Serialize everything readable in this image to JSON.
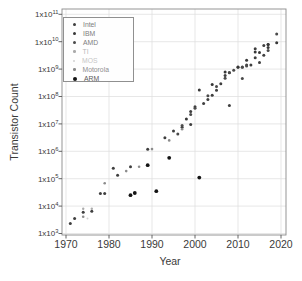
{
  "window": {
    "width": 302,
    "height": 281,
    "background": "#ffffff"
  },
  "chart_data": {
    "type": "scatter",
    "title": "",
    "xlabel": "Year",
    "ylabel": "Transistor Count",
    "grid": true,
    "style": {
      "frame_color": "#8a8a8a",
      "grid_color": "#dcdcdc",
      "tick_color": "#555555",
      "text_color": "#3a3a3a",
      "background": "#ffffff"
    },
    "x_axis": {
      "scale": "linear",
      "min": 1969,
      "max": 2021.2,
      "ticks": [
        1970,
        1980,
        1990,
        2000,
        2010,
        2020
      ]
    },
    "y_axis": {
      "scale": "log",
      "min": 1000,
      "max": 100000000000,
      "tick_label_prefix": "1x10",
      "tick_exponents": [
        3,
        4,
        5,
        6,
        7,
        8,
        9,
        10,
        11
      ]
    },
    "legend": {
      "position": "top-left",
      "border": true
    },
    "series": [
      {
        "name": "Intel",
        "color": "#3f3f3f",
        "text_color": "#7d7d7d",
        "marker_radius": 1.5,
        "legend_marker_px": 3,
        "points": [
          [
            1971,
            2300
          ],
          [
            1972,
            3500
          ],
          [
            1974,
            6000
          ],
          [
            1976,
            6500
          ],
          [
            1978,
            29000
          ],
          [
            1979,
            29000
          ],
          [
            1981,
            240000
          ],
          [
            1982,
            134000
          ],
          [
            1985,
            275000
          ],
          [
            1989,
            1180000
          ],
          [
            1993,
            3100000
          ],
          [
            1995,
            5500000
          ],
          [
            1997,
            7500000
          ],
          [
            1999,
            9500000
          ],
          [
            1999,
            28000000
          ],
          [
            2000,
            42000000
          ],
          [
            2002,
            55000000
          ],
          [
            2003,
            77000000
          ],
          [
            2004,
            112000000
          ],
          [
            2005,
            169000000
          ],
          [
            2006,
            291000000
          ],
          [
            2007,
            582000000
          ],
          [
            2008,
            731000000
          ],
          [
            2008,
            47000000
          ],
          [
            2010,
            1170000000
          ],
          [
            2011,
            1160000000
          ],
          [
            2012,
            1400000000
          ],
          [
            2013,
            1400000000
          ],
          [
            2014,
            2600000000
          ],
          [
            2014,
            5560000000
          ],
          [
            2015,
            1750000000
          ],
          [
            2016,
            3200000000
          ],
          [
            2016,
            7200000000
          ],
          [
            2017,
            8000000000
          ]
        ]
      },
      {
        "name": "IBM",
        "color": "#373737",
        "text_color": "#7d7d7d",
        "marker_radius": 1.5,
        "legend_marker_px": 3,
        "points": [
          [
            1998,
            15000000
          ],
          [
            2001,
            174000000
          ],
          [
            2004,
            276000000
          ],
          [
            2007,
            789000000
          ],
          [
            2010,
            1200000000
          ],
          [
            2012,
            2100000000
          ],
          [
            2014,
            4200000000
          ],
          [
            2015,
            3990000000
          ],
          [
            2017,
            6100000000
          ],
          [
            2017,
            8000000000
          ],
          [
            2019,
            9200000000
          ]
        ]
      },
      {
        "name": "AMD",
        "color": "#4a4a4a",
        "text_color": "#7d7d7d",
        "marker_radius": 1.5,
        "legend_marker_px": 3,
        "points": [
          [
            1996,
            4300000
          ],
          [
            1997,
            8800000
          ],
          [
            1999,
            22000000
          ],
          [
            2000,
            37000000
          ],
          [
            2003,
            106000000
          ],
          [
            2005,
            233000000
          ],
          [
            2007,
            463000000
          ],
          [
            2008,
            758000000
          ],
          [
            2009,
            904000000
          ],
          [
            2011,
            450000000
          ],
          [
            2011,
            1200000000
          ],
          [
            2012,
            1303000000
          ],
          [
            2017,
            4800000000
          ],
          [
            2019,
            19200000000
          ]
        ]
      },
      {
        "name": "TI",
        "color": "#ababab",
        "text_color": "#b8b8b8",
        "marker_radius": 1.2,
        "legend_marker_px": 2.5,
        "points": [
          [
            1974,
            8000
          ],
          [
            1976,
            8000
          ]
        ]
      },
      {
        "name": "MOS",
        "color": "#d2d2d2",
        "text_color": "#c6c6c6",
        "marker_radius": 1.0,
        "legend_marker_px": 2,
        "points": [
          [
            1975,
            3510
          ]
        ]
      },
      {
        "name": "Motorola",
        "color": "#8c8c8c",
        "text_color": "#8e8e8e",
        "marker_radius": 1.3,
        "legend_marker_px": 2.5,
        "points": [
          [
            1974,
            4100
          ],
          [
            1979,
            68000
          ],
          [
            1984,
            190000
          ],
          [
            1987,
            273000
          ],
          [
            1990,
            1200000
          ],
          [
            1994,
            2500000
          ],
          [
            1997,
            6350000
          ]
        ]
      },
      {
        "name": "ARM",
        "color": "#141414",
        "text_color": "#5a5a5a",
        "marker_radius": 1.9,
        "legend_marker_px": 4,
        "points": [
          [
            1985,
            25000
          ],
          [
            1986,
            30000
          ],
          [
            1989,
            310000
          ],
          [
            1991,
            35000
          ],
          [
            1994,
            578000
          ],
          [
            2001,
            110000
          ]
        ]
      }
    ]
  }
}
